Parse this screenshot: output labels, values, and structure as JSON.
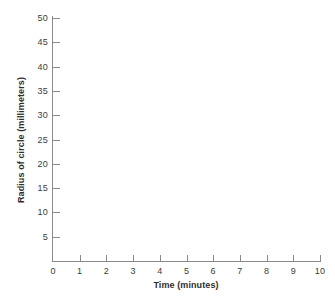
{
  "chart_data": {
    "type": "scatter",
    "title": "",
    "subtitle": "",
    "xlabel": "Time (minutes)",
    "ylabel": "Radius of circle (millimeters)",
    "xlim": [
      0,
      10
    ],
    "ylim": [
      0,
      52
    ],
    "x_ticks": [
      0,
      1,
      2,
      3,
      4,
      5,
      6,
      7,
      8,
      9,
      10
    ],
    "x_tick_labels": [
      "0",
      "1",
      "2",
      "3",
      "4",
      "5",
      "6",
      "7",
      "8",
      "9",
      "10"
    ],
    "y_ticks": [
      5,
      10,
      15,
      20,
      25,
      30,
      35,
      40,
      45,
      50
    ],
    "y_tick_labels": [
      "5",
      "10",
      "15",
      "20",
      "25",
      "30",
      "35",
      "40",
      "45",
      "50"
    ],
    "grid": false,
    "legend": null,
    "series": [],
    "values": [],
    "annotations": [],
    "note": "Empty graph template: axes drawn with tick marks and labels, no data plotted.",
    "colors": {
      "axis": "#8b8b8b",
      "tick": "#8b8b8b",
      "tick_label_text": "#3c3c3c",
      "axis_title_text": "#2e2e2e",
      "background": "#ffffff"
    }
  }
}
